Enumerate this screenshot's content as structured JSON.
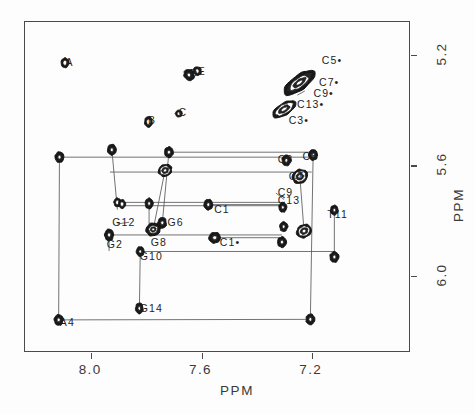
{
  "chart_data": {
    "type": "scatter",
    "title": "",
    "subtitle": "",
    "xlabel": "PPM",
    "ylabel": "PPM",
    "xlim": [
      8.24,
      6.84
    ],
    "ylim": [
      6.28,
      5.08
    ],
    "x_ticks": [
      8.0,
      7.6,
      7.2
    ],
    "x_tick_labels": [
      "8.0",
      "7.6",
      "7.2"
    ],
    "y_ticks": [
      5.2,
      5.6,
      6.0
    ],
    "y_tick_labels": [
      "5.2",
      "5.6",
      "6.0"
    ],
    "grid": false,
    "legend": "none",
    "axis_note": "Both axes decrease left-to-right / top-to-bottom (NMR chemical shift convention)",
    "plot_kind": "2D NMR NOESY contour plot with sequential connectivity walk",
    "annotations": [
      {
        "label": "A",
        "x": 8.09,
        "y": 5.23,
        "marker": true
      },
      {
        "label": "D",
        "x": 7.64,
        "y": 5.27,
        "marker": true
      },
      {
        "label": "E",
        "x": 7.61,
        "y": 5.26,
        "marker": true
      },
      {
        "label": "B",
        "x": 7.79,
        "y": 5.44,
        "marker": true
      },
      {
        "label": "C",
        "x": 7.68,
        "y": 5.41,
        "marker": true
      },
      {
        "label": "C5•",
        "x": 7.16,
        "y": 5.22,
        "marker": false
      },
      {
        "label": "C7•",
        "x": 7.17,
        "y": 5.3,
        "marker": false
      },
      {
        "label": "C9•",
        "x": 7.19,
        "y": 5.34,
        "marker": false
      },
      {
        "label": "C13•",
        "x": 7.25,
        "y": 5.38,
        "marker": false
      },
      {
        "label": "C3•",
        "x": 7.28,
        "y": 5.44,
        "marker": false
      },
      {
        "label": "C5",
        "x": 7.23,
        "y": 5.57,
        "marker": true
      },
      {
        "label": "C3",
        "x": 7.32,
        "y": 5.58,
        "marker": true
      },
      {
        "label": "C7",
        "x": 7.28,
        "y": 5.64,
        "marker": true
      },
      {
        "label": "C9",
        "x": 7.32,
        "y": 5.7,
        "marker": false
      },
      {
        "label": "C13",
        "x": 7.32,
        "y": 5.73,
        "marker": false
      },
      {
        "label": "C1",
        "x": 7.55,
        "y": 5.76,
        "marker": true
      },
      {
        "label": "T11",
        "x": 7.14,
        "y": 5.78,
        "marker": true
      },
      {
        "label": "G6",
        "x": 7.72,
        "y": 5.81,
        "marker": true
      },
      {
        "label": "G12",
        "x": 7.92,
        "y": 5.81,
        "marker": true
      },
      {
        "label": "G8",
        "x": 7.78,
        "y": 5.88,
        "marker": true
      },
      {
        "label": "C1•",
        "x": 7.53,
        "y": 5.88,
        "marker": true
      },
      {
        "label": "G2",
        "x": 7.94,
        "y": 5.89,
        "marker": true
      },
      {
        "label": "G10",
        "x": 7.82,
        "y": 5.93,
        "marker": true
      },
      {
        "label": "G14",
        "x": 7.82,
        "y": 6.12,
        "marker": true
      },
      {
        "label": "A4",
        "x": 8.11,
        "y": 6.17,
        "marker": true
      }
    ],
    "peaks": [
      {
        "id": "A",
        "x": 8.095,
        "y": 5.228,
        "w": 8,
        "h": 10,
        "rot": 0,
        "rings": 2
      },
      {
        "id": "D",
        "x": 7.645,
        "y": 5.272,
        "w": 10,
        "h": 12,
        "rot": -35,
        "rings": 3
      },
      {
        "id": "E",
        "x": 7.615,
        "y": 5.258,
        "w": 8,
        "h": 9,
        "rot": -30,
        "rings": 2
      },
      {
        "id": "B",
        "x": 7.792,
        "y": 5.442,
        "w": 8,
        "h": 11,
        "rot": 0,
        "rings": 2
      },
      {
        "id": "C",
        "x": 7.682,
        "y": 5.412,
        "w": 7,
        "h": 7,
        "rot": 0,
        "rings": 2
      },
      {
        "id": "diagC5C7C9",
        "x": 7.245,
        "y": 5.3,
        "w": 38,
        "h": 15,
        "rot": -36,
        "rings": 5
      },
      {
        "id": "diagC13C3",
        "x": 7.3,
        "y": 5.396,
        "w": 27,
        "h": 12,
        "rot": -32,
        "rings": 4
      },
      {
        "id": "G12d",
        "x": 7.925,
        "y": 5.543,
        "w": 9,
        "h": 11,
        "rot": 0,
        "rings": 3
      },
      {
        "id": "A4d",
        "x": 8.115,
        "y": 5.57,
        "w": 9,
        "h": 11,
        "rot": 0,
        "rings": 3
      },
      {
        "id": "G6d",
        "x": 7.718,
        "y": 5.552,
        "w": 9,
        "h": 11,
        "rot": 0,
        "rings": 3
      },
      {
        "id": "C5p",
        "x": 7.195,
        "y": 5.562,
        "w": 9,
        "h": 11,
        "rot": 0,
        "rings": 3
      },
      {
        "id": "C3p",
        "x": 7.292,
        "y": 5.582,
        "w": 9,
        "h": 11,
        "rot": 0,
        "rings": 3
      },
      {
        "id": "G8d",
        "x": 7.732,
        "y": 5.618,
        "w": 14,
        "h": 12,
        "rot": -25,
        "rings": 4
      },
      {
        "id": "C7p",
        "x": 7.243,
        "y": 5.64,
        "w": 16,
        "h": 14,
        "rot": -30,
        "rings": 4
      },
      {
        "id": "G12b",
        "x": 7.905,
        "y": 5.734,
        "w": 7,
        "h": 9,
        "rot": 0,
        "rings": 2
      },
      {
        "id": "G12c",
        "x": 7.888,
        "y": 5.74,
        "w": 7,
        "h": 9,
        "rot": 0,
        "rings": 2
      },
      {
        "id": "G6b",
        "x": 7.79,
        "y": 5.738,
        "w": 8,
        "h": 11,
        "rot": 0,
        "rings": 3
      },
      {
        "id": "C1p",
        "x": 7.575,
        "y": 5.742,
        "w": 9,
        "h": 11,
        "rot": 0,
        "rings": 3
      },
      {
        "id": "C9p",
        "x": 7.305,
        "y": 5.752,
        "w": 8,
        "h": 10,
        "rot": 0,
        "rings": 3
      },
      {
        "id": "T11p",
        "x": 7.118,
        "y": 5.762,
        "w": 8,
        "h": 10,
        "rot": 0,
        "rings": 3
      },
      {
        "id": "G2p",
        "x": 7.935,
        "y": 5.852,
        "w": 9,
        "h": 12,
        "rot": 0,
        "rings": 3
      },
      {
        "id": "G8b",
        "x": 7.775,
        "y": 5.832,
        "w": 15,
        "h": 13,
        "rot": -20,
        "rings": 5
      },
      {
        "id": "G6c",
        "x": 7.742,
        "y": 5.808,
        "w": 9,
        "h": 11,
        "rot": 0,
        "rings": 3
      },
      {
        "id": "C13p",
        "x": 7.302,
        "y": 5.822,
        "w": 8,
        "h": 10,
        "rot": 0,
        "rings": 3
      },
      {
        "id": "C7b",
        "x": 7.228,
        "y": 5.838,
        "w": 16,
        "h": 13,
        "rot": -28,
        "rings": 4
      },
      {
        "id": "C1pp",
        "x": 7.552,
        "y": 5.862,
        "w": 12,
        "h": 11,
        "rot": -15,
        "rings": 3
      },
      {
        "id": "C5b",
        "x": 7.308,
        "y": 5.878,
        "w": 9,
        "h": 11,
        "rot": 0,
        "rings": 3
      },
      {
        "id": "G10p",
        "x": 7.822,
        "y": 5.912,
        "w": 8,
        "h": 10,
        "rot": 0,
        "rings": 3
      },
      {
        "id": "T11b",
        "x": 7.118,
        "y": 5.932,
        "w": 9,
        "h": 11,
        "rot": 0,
        "rings": 3
      },
      {
        "id": "G14p",
        "x": 7.825,
        "y": 6.118,
        "w": 8,
        "h": 11,
        "rot": 0,
        "rings": 3
      },
      {
        "id": "A4p",
        "x": 8.118,
        "y": 6.16,
        "w": 9,
        "h": 11,
        "rot": 0,
        "rings": 3
      },
      {
        "id": "A4end",
        "x": 7.205,
        "y": 6.158,
        "w": 9,
        "h": 11,
        "rot": 0,
        "rings": 3
      }
    ],
    "connectivity": [
      {
        "from": [
          8.115,
          5.57
        ],
        "to": [
          7.205,
          5.57
        ]
      },
      {
        "from": [
          8.115,
          5.57
        ],
        "to": [
          8.118,
          6.16
        ]
      },
      {
        "from": [
          8.118,
          6.16
        ],
        "to": [
          7.205,
          6.158
        ]
      },
      {
        "from": [
          7.718,
          5.552
        ],
        "to": [
          7.195,
          5.552
        ]
      },
      {
        "from": [
          7.718,
          5.552
        ],
        "to": [
          7.742,
          5.808
        ]
      },
      {
        "from": [
          7.925,
          5.543
        ],
        "to": [
          7.905,
          5.76
        ]
      },
      {
        "from": [
          7.932,
          5.624
        ],
        "to": [
          7.2,
          5.624
        ]
      },
      {
        "from": [
          7.732,
          5.618
        ],
        "to": [
          7.775,
          5.832
        ]
      },
      {
        "from": [
          7.905,
          5.734
        ],
        "to": [
          7.3,
          5.734
        ]
      },
      {
        "from": [
          7.888,
          5.746
        ],
        "to": [
          7.3,
          5.746
        ]
      },
      {
        "from": [
          7.935,
          5.852
        ],
        "to": [
          7.308,
          5.852
        ]
      },
      {
        "from": [
          7.935,
          5.852
        ],
        "to": [
          7.935,
          5.91
        ]
      },
      {
        "from": [
          7.822,
          5.912
        ],
        "to": [
          7.118,
          5.912
        ]
      },
      {
        "from": [
          7.822,
          5.912
        ],
        "to": [
          7.825,
          6.118
        ]
      },
      {
        "from": [
          7.575,
          5.742
        ],
        "to": [
          7.305,
          5.742
        ]
      },
      {
        "from": [
          7.552,
          5.862
        ],
        "to": [
          7.308,
          5.862
        ]
      },
      {
        "from": [
          7.118,
          5.762
        ],
        "to": [
          7.118,
          5.932
        ]
      },
      {
        "from": [
          7.195,
          5.562
        ],
        "to": [
          7.205,
          6.158
        ]
      },
      {
        "from": [
          7.243,
          5.64
        ],
        "to": [
          7.228,
          5.838
        ]
      },
      {
        "from": [
          7.79,
          5.738
        ],
        "to": [
          7.79,
          5.832
        ]
      }
    ],
    "colors": {
      "contour": "#141414",
      "contour_fill": "#1a1a1a",
      "axis": "#4a4a4a",
      "connectivity_line": "#5a5a5a",
      "text": "#1e1e1e",
      "background": "#fdfdfd"
    }
  }
}
